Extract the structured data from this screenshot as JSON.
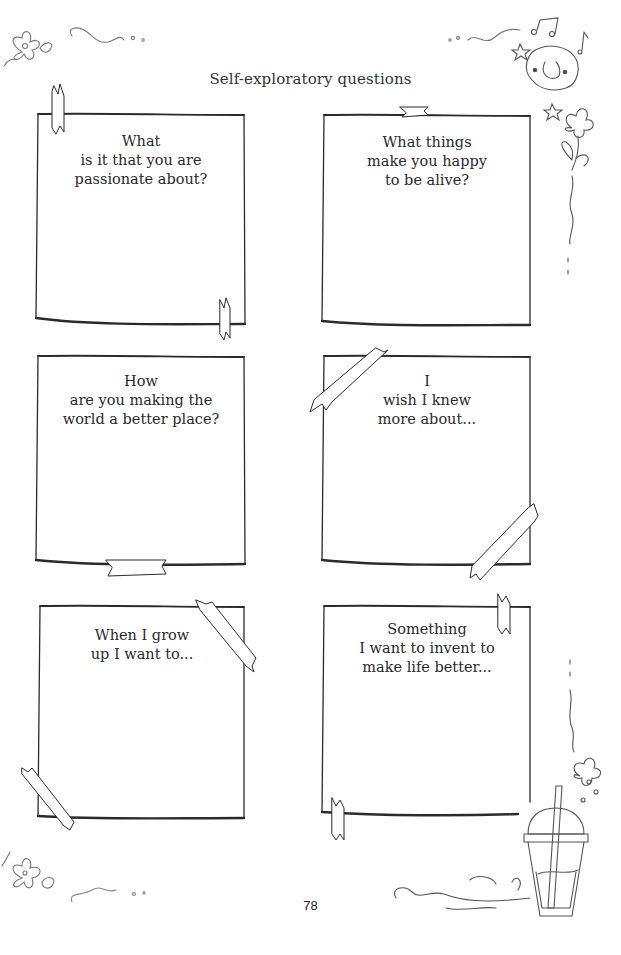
{
  "page": {
    "title": "Self-exploratory questions",
    "page_number": "78"
  },
  "cards": [
    {
      "lines": [
        "What",
        "is it that you are",
        "passionate about?"
      ]
    },
    {
      "lines": [
        "What things",
        "make you happy",
        "to be alive?"
      ]
    },
    {
      "lines": [
        "How",
        "are you making the",
        "world a better place?"
      ]
    },
    {
      "lines": [
        "I",
        "wish I knew",
        "more about..."
      ]
    },
    {
      "lines": [
        "When I grow",
        "up I want to..."
      ]
    },
    {
      "lines": [
        "Something",
        "I want to invent to",
        "make life better..."
      ]
    }
  ],
  "decorations": [
    "flower-icon",
    "swirl-icon",
    "smiling-cloud-icon",
    "music-note-icon",
    "star-icon",
    "bubble-tea-cup-icon"
  ]
}
